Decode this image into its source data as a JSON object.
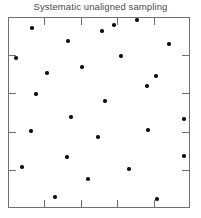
{
  "title": "Systematic unaligned sampling",
  "colors": {
    "point": "#111111",
    "frame": "#6f6f6f",
    "title": "#4a4a4a",
    "background": "#ffffff"
  },
  "chart_data": {
    "type": "scatter",
    "title": "Systematic unaligned sampling",
    "xlabel": "",
    "ylabel": "",
    "xlim": [
      0,
      100
    ],
    "ylim": [
      0,
      100
    ],
    "grid": false,
    "legend": null,
    "axis_ticks": {
      "top_count": 4,
      "bottom_count": 4,
      "left_count": 4,
      "right_count": 4,
      "direction": "inward",
      "labels": [],
      "top_positions": [
        20,
        40,
        60,
        80
      ],
      "bottom_positions": [
        20,
        40,
        60,
        80
      ],
      "left_positions": [
        20,
        40,
        60,
        80
      ],
      "right_positions": [
        20,
        40,
        60,
        80
      ]
    },
    "series": [
      {
        "name": "sample points",
        "marker": "filled-circle",
        "color": "#111111",
        "points": [
          {
            "x": 13.2,
            "y": 94.2
          },
          {
            "x": 51.6,
            "y": 92.7
          },
          {
            "x": 58.2,
            "y": 95.8
          },
          {
            "x": 70.9,
            "y": 98.4
          },
          {
            "x": 33.0,
            "y": 87.4
          },
          {
            "x": 88.5,
            "y": 85.9
          },
          {
            "x": 4.4,
            "y": 78.5
          },
          {
            "x": 62.1,
            "y": 79.6
          },
          {
            "x": 40.7,
            "y": 73.8
          },
          {
            "x": 21.4,
            "y": 70.7
          },
          {
            "x": 81.3,
            "y": 69.1
          },
          {
            "x": 15.4,
            "y": 59.7
          },
          {
            "x": 76.4,
            "y": 63.9
          },
          {
            "x": 53.3,
            "y": 56.0
          },
          {
            "x": 34.6,
            "y": 47.6
          },
          {
            "x": 96.7,
            "y": 46.6
          },
          {
            "x": 12.6,
            "y": 40.3
          },
          {
            "x": 76.9,
            "y": 40.8
          },
          {
            "x": 49.5,
            "y": 37.2
          },
          {
            "x": 32.4,
            "y": 26.7
          },
          {
            "x": 96.7,
            "y": 27.2
          },
          {
            "x": 7.7,
            "y": 21.5
          },
          {
            "x": 66.5,
            "y": 20.4
          },
          {
            "x": 44.0,
            "y": 15.2
          },
          {
            "x": 25.8,
            "y": 5.8
          },
          {
            "x": 81.9,
            "y": 4.7
          }
        ]
      }
    ]
  }
}
